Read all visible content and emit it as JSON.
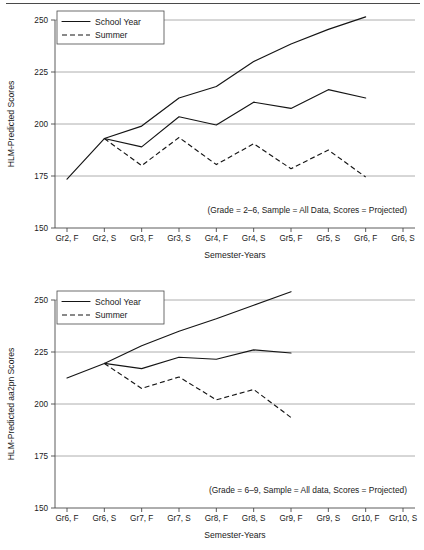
{
  "chart_data": [
    {
      "id": "top",
      "type": "line",
      "title": "",
      "xlabel": "Semester-Years",
      "ylabel": "HLM-Predicted Scores",
      "ylim": [
        150,
        250
      ],
      "yticks": [
        150,
        175,
        200,
        225,
        250
      ],
      "grid": true,
      "legend_position": "top-left",
      "annotation": "(Grade = 2–6, Sample = All Data, Scores = Projected)",
      "categories": [
        "Gr2, F",
        "Gr2, S",
        "Gr3, F",
        "Gr3, S",
        "Gr4, F",
        "Gr4, S",
        "Gr5, F",
        "Gr5, S",
        "Gr6, F",
        "Gr6, S"
      ],
      "series": [
        {
          "name": "School Year",
          "style": "solid",
          "x": [
            "Gr2, F",
            "Gr2, S",
            "Gr3, F",
            "Gr3, S",
            "Gr4, F",
            "Gr4, S",
            "Gr5, F",
            "Gr5, S",
            "Gr6, F"
          ],
          "values": [
            173.5,
            193.0,
            199.0,
            212.5,
            218.0,
            230.0,
            238.5,
            245.5,
            251.5
          ]
        },
        {
          "name": "School Year",
          "style": "solid",
          "x": [
            "Gr2, S",
            "Gr3, F",
            "Gr3, S",
            "Gr4, F",
            "Gr4, S",
            "Gr5, F",
            "Gr5, S",
            "Gr6, F"
          ],
          "values": [
            193.0,
            189.0,
            203.5,
            199.5,
            210.5,
            207.5,
            216.5,
            212.5
          ]
        },
        {
          "name": "Summer",
          "style": "dashed",
          "x": [
            "Gr2, S",
            "Gr3, F",
            "Gr3, S",
            "Gr4, F",
            "Gr4, S",
            "Gr5, F",
            "Gr5, S",
            "Gr6, F"
          ],
          "values": [
            193.0,
            180.0,
            193.5,
            180.5,
            190.5,
            178.5,
            187.5,
            174.5
          ]
        }
      ]
    },
    {
      "id": "bottom",
      "type": "line",
      "title": "",
      "xlabel": "Semester-Years",
      "ylabel": "HLM-Predicted aa2pn Scores",
      "ylim": [
        150,
        250
      ],
      "yticks": [
        150,
        175,
        200,
        225,
        250
      ],
      "grid": true,
      "legend_position": "top-left",
      "annotation": "(Grade = 6–9, Sample = All data, Scores = Projected)",
      "categories": [
        "Gr6, F",
        "Gr6, S",
        "Gr7, F",
        "Gr7, S",
        "Gr8, F",
        "Gr8, S",
        "Gr9, F",
        "Gr9, S",
        "Gr10, F",
        "Gr10, S"
      ],
      "series": [
        {
          "name": "School Year",
          "style": "solid",
          "x": [
            "Gr6, F",
            "Gr6, S",
            "Gr7, F",
            "Gr7, S",
            "Gr8, F",
            "Gr8, S",
            "Gr9, F"
          ],
          "values": [
            212.5,
            219.5,
            228.0,
            235.0,
            241.0,
            247.5,
            254.0
          ]
        },
        {
          "name": "School Year",
          "style": "solid",
          "x": [
            "Gr6, S",
            "Gr7, F",
            "Gr7, S",
            "Gr8, F",
            "Gr8, S",
            "Gr9, F"
          ],
          "values": [
            219.5,
            217.0,
            222.5,
            221.5,
            226.0,
            224.5
          ]
        },
        {
          "name": "Summer",
          "style": "dashed",
          "x": [
            "Gr6, S",
            "Gr7, F",
            "Gr7, S",
            "Gr8, F",
            "Gr8, S",
            "Gr9, F"
          ],
          "values": [
            219.5,
            207.5,
            213.0,
            202.0,
            207.0,
            193.5
          ]
        }
      ]
    }
  ],
  "figures": [
    {
      "legend": {
        "items": [
          {
            "label": "School Year",
            "style": "solid"
          },
          {
            "label": "Summer",
            "style": "dashed"
          }
        ]
      },
      "ylabel": "HLM-Predicted Scores",
      "xlabel": "Semester-Years",
      "annotation": "(Grade = 2–6, Sample = All Data, Scores = Projected)",
      "yticks": [
        "250",
        "225",
        "200",
        "175",
        "150"
      ],
      "xticks": [
        "Gr2, F",
        "Gr2, S",
        "Gr3, F",
        "Gr3, S",
        "Gr4, F",
        "Gr4, S",
        "Gr5, F",
        "Gr5, S",
        "Gr6, F",
        "Gr6, S"
      ]
    },
    {
      "legend": {
        "items": [
          {
            "label": "School Year",
            "style": "solid"
          },
          {
            "label": "Summer",
            "style": "dashed"
          }
        ]
      },
      "ylabel": "HLM-Predicted aa2pn Scores",
      "xlabel": "Semester-Years",
      "annotation": "(Grade = 6–9, Sample = All data, Scores = Projected)",
      "yticks": [
        "250",
        "225",
        "200",
        "175",
        "150"
      ],
      "xticks": [
        "Gr6, F",
        "Gr6, S",
        "Gr7, F",
        "Gr7, S",
        "Gr8, F",
        "Gr8, S",
        "Gr9, F",
        "Gr9, S",
        "Gr10, F",
        "Gr10, S"
      ]
    }
  ],
  "colors": {
    "line": "#151515",
    "grid": "#9a9a9a",
    "axis": "#4a4a4a",
    "background": "#ffffff"
  }
}
